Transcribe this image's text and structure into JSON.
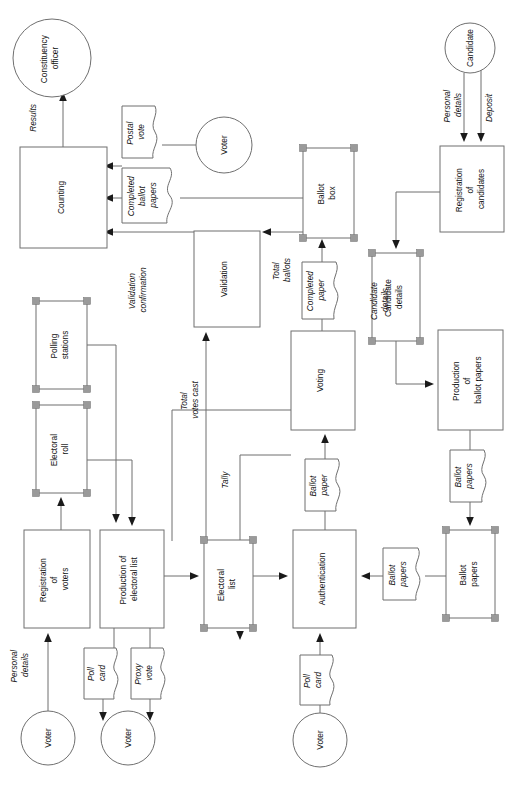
{
  "diagram": {
    "orientation": "rotated-90-ccw",
    "colors": {
      "background": "#ffffff",
      "shape_stroke": "#6f6f6f",
      "text": "#111111",
      "arrow_fill": "#1a1a1a",
      "handle_fill": "#9a9a9a"
    },
    "processes": [
      {
        "id": "counting",
        "label_lines": [
          "Counting"
        ],
        "x": 20,
        "y": 147,
        "w": 87,
        "h": 101
      },
      {
        "id": "validation",
        "label_lines": [
          "Validation"
        ],
        "x": 194,
        "y": 231,
        "w": 66,
        "h": 96
      },
      {
        "id": "voting",
        "label_lines": [
          "Voting"
        ],
        "x": 291,
        "y": 331,
        "w": 64,
        "h": 99
      },
      {
        "id": "reg-candidates",
        "label_lines": [
          "Registration",
          "of",
          "candidates"
        ],
        "x": 440,
        "y": 146,
        "w": 64,
        "h": 86
      },
      {
        "id": "prod-ballot",
        "label_lines": [
          "Production",
          "of",
          "ballot papers"
        ],
        "x": 438,
        "y": 330,
        "w": 65,
        "h": 100
      },
      {
        "id": "reg-voters",
        "label_lines": [
          "Registration",
          "of",
          "voters"
        ],
        "x": 24,
        "y": 530,
        "w": 66,
        "h": 98
      },
      {
        "id": "prod-list",
        "label_lines": [
          "Production of",
          "electoral list"
        ],
        "x": 100,
        "y": 530,
        "w": 64,
        "h": 98
      },
      {
        "id": "authentication",
        "label_lines": [
          "Authentication"
        ],
        "x": 293,
        "y": 530,
        "w": 63,
        "h": 98
      }
    ],
    "datastores": [
      {
        "id": "ballot-box",
        "label_lines": [
          "Ballot",
          "box"
        ],
        "x": 303,
        "y": 148,
        "w": 51,
        "h": 90
      },
      {
        "id": "polling-stations",
        "label_lines": [
          "Polling",
          "stations"
        ],
        "x": 36,
        "y": 301,
        "w": 51,
        "h": 88
      },
      {
        "id": "candidate-details",
        "label_lines": [
          "Candidate",
          "details"
        ],
        "x": 372,
        "y": 253,
        "w": 48,
        "h": 88
      },
      {
        "id": "electoral-roll",
        "label_lines": [
          "Electoral",
          "roll"
        ],
        "x": 36,
        "y": 405,
        "w": 51,
        "h": 88
      },
      {
        "id": "electoral-list",
        "label_lines": [
          "Electoral",
          "list"
        ],
        "x": 204,
        "y": 540,
        "w": 49,
        "h": 88
      },
      {
        "id": "ballot-papers-store",
        "label_lines": [
          "Ballot",
          "papers"
        ],
        "x": 446,
        "y": 530,
        "w": 49,
        "h": 88
      }
    ],
    "entities": [
      {
        "id": "constituency-officer",
        "label_lines": [
          "Constituency",
          "officer"
        ],
        "cx": 52,
        "cy": 58,
        "r": 39
      },
      {
        "id": "candidate",
        "label_lines": [
          "Candidate"
        ],
        "cx": 470,
        "cy": 48,
        "r": 25
      },
      {
        "id": "voter-postal",
        "label_lines": [
          "Voter"
        ],
        "cx": 224,
        "cy": 145,
        "r": 28
      },
      {
        "id": "voter-register",
        "label_lines": [
          "Voter"
        ],
        "cx": 48,
        "cy": 738,
        "r": 27
      },
      {
        "id": "voter-cards",
        "label_lines": [
          "Voter"
        ],
        "cx": 128,
        "cy": 738,
        "r": 27
      },
      {
        "id": "voter-auth",
        "label_lines": [
          "Voter"
        ],
        "cx": 320,
        "cy": 740,
        "r": 27
      }
    ],
    "documents": [
      {
        "id": "postal-vote",
        "label_lines": [
          "Postal",
          "vote"
        ],
        "x": 122,
        "y": 106,
        "w": 40,
        "h": 52
      },
      {
        "id": "completed-ballot-papers",
        "label_lines": [
          "Completed",
          "ballot",
          "papers"
        ],
        "x": 122,
        "y": 168,
        "w": 58,
        "h": 55
      },
      {
        "id": "completed-paper",
        "label_lines": [
          "Completed",
          "paper"
        ],
        "x": 302,
        "y": 262,
        "w": 41,
        "h": 57
      },
      {
        "id": "ballot-paper",
        "label_lines": [
          "Ballot",
          "paper"
        ],
        "x": 305,
        "y": 459,
        "w": 40,
        "h": 52
      },
      {
        "id": "ballot-papers-doc",
        "label_lines": [
          "Ballot",
          "papers"
        ],
        "x": 383,
        "y": 548,
        "w": 42,
        "h": 52
      },
      {
        "id": "ballot-papers-prod",
        "label_lines": [
          "Ballot",
          "papers"
        ],
        "x": 450,
        "y": 450,
        "w": 41,
        "h": 52
      },
      {
        "id": "poll-card-voters",
        "label_lines": [
          "Poll",
          "card"
        ],
        "x": 84,
        "y": 648,
        "w": 38,
        "h": 51
      },
      {
        "id": "proxy-vote",
        "label_lines": [
          "Proxy",
          "vote"
        ],
        "x": 131,
        "y": 648,
        "w": 38,
        "h": 51
      },
      {
        "id": "poll-card-auth",
        "label_lines": [
          "Poll",
          "card"
        ],
        "x": 300,
        "y": 655,
        "w": 38,
        "h": 50
      }
    ],
    "flow_labels": [
      {
        "id": "results",
        "text_lines": [
          "Results"
        ],
        "x": 36,
        "y": 118
      },
      {
        "id": "validation-confirmation",
        "text_lines": [
          "Validation",
          "confirmation"
        ],
        "x": 140,
        "y": 290
      },
      {
        "id": "total-ballots",
        "text_lines": [
          "Total",
          "ballots"
        ],
        "x": 284,
        "y": 270
      },
      {
        "id": "candidate-details-flow",
        "text_lines": [
          "Candidate",
          "details"
        ],
        "x": 396,
        "y": 300
      },
      {
        "id": "personal-details-cand",
        "text_lines": [
          "Personal",
          "details"
        ],
        "x": 455,
        "y": 105
      },
      {
        "id": "deposit",
        "text_lines": [
          "Deposit"
        ],
        "x": 489,
        "y": 108
      },
      {
        "id": "total-votes-cast",
        "text_lines": [
          "Total",
          "votes cast"
        ],
        "x": 197,
        "y": 400
      },
      {
        "id": "tally",
        "text_lines": [
          "Tally"
        ],
        "x": 245,
        "y": 470
      },
      {
        "id": "personal-details-voter",
        "text_lines": [
          "Personal",
          "details"
        ],
        "x": 16,
        "y": 665
      }
    ]
  }
}
